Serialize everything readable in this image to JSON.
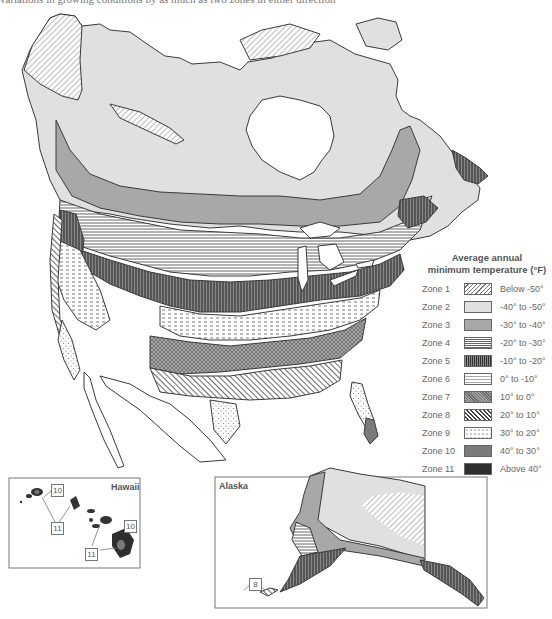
{
  "caption": "variations in growing conditions by as much as two zones in either direction",
  "legend": {
    "title_line1": "Average annual",
    "title_line2": "minimum temperature (°F)",
    "zones": [
      {
        "zone": "Zone 1",
        "range": "Below -50°",
        "pattern": "diag-light",
        "color": "#ffffff"
      },
      {
        "zone": "Zone 2",
        "range": "-40° to -50°",
        "pattern": "solid",
        "color": "#e0e0e0"
      },
      {
        "zone": "Zone 3",
        "range": "-30° to -40°",
        "pattern": "solid",
        "color": "#a8a8a8"
      },
      {
        "zone": "Zone 4",
        "range": "-20° to -30°",
        "pattern": "horizontal",
        "color": "#ffffff"
      },
      {
        "zone": "Zone 5",
        "range": "-10° to -20°",
        "pattern": "vertical",
        "color": "#6e6e6e"
      },
      {
        "zone": "Zone 6",
        "range": "0° to -10°",
        "pattern": "dashes",
        "color": "#ffffff"
      },
      {
        "zone": "Zone 7",
        "range": "10° to 0°",
        "pattern": "crosshatch",
        "color": "#a0a0a0"
      },
      {
        "zone": "Zone 8",
        "range": "20° to 10°",
        "pattern": "diag-heavy",
        "color": "#ffffff"
      },
      {
        "zone": "Zone 9",
        "range": "30° to 20°",
        "pattern": "dots",
        "color": "#ffffff"
      },
      {
        "zone": "Zone 10",
        "range": "40° to 30°",
        "pattern": "solid",
        "color": "#7a7a7a"
      },
      {
        "zone": "Zone 11",
        "range": "Above 40°",
        "pattern": "solid",
        "color": "#2e2e2e"
      }
    ]
  },
  "insets": {
    "hawaii": {
      "label": "Hawaii",
      "callouts": [
        "10",
        "11",
        "11",
        "10"
      ]
    },
    "alaska": {
      "label": "Alaska",
      "callouts": [
        "8"
      ]
    }
  }
}
